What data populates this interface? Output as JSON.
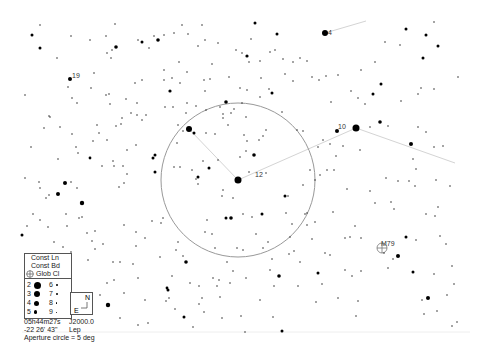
{
  "legend": {
    "const_lines": "Const Ln",
    "const_bounds": "Const Bd",
    "glob_cl": "Glob Cl",
    "magnitudes": [
      {
        "mag": "2",
        "size": 7
      },
      {
        "mag": "6",
        "size": 3
      },
      {
        "mag": "3",
        "size": 6
      },
      {
        "mag": "7",
        "size": 2.5
      },
      {
        "mag": "4",
        "size": 5
      },
      {
        "mag": "8",
        "size": 2
      },
      {
        "mag": "5",
        "size": 4
      },
      {
        "mag": "9",
        "size": 1.5
      }
    ]
  },
  "compass": {
    "north": "N",
    "east": "E"
  },
  "info": {
    "ra": "05h44m27s",
    "epoch": "J2000.0",
    "dec": "-22 26' 43\"",
    "constellation": "Lep",
    "aperture": "Aperture circle = 5 deg"
  },
  "labels": {
    "star_19": "19",
    "star_4": "4",
    "star_10": "10",
    "star_12": "12",
    "m79": "M79"
  },
  "aperture_circle": {
    "cx": 238,
    "cy": 180,
    "r": 77
  },
  "colors": {
    "background": "#ffffff",
    "stars": "#000000",
    "lines": "#cccccc",
    "circle": "#888888"
  }
}
